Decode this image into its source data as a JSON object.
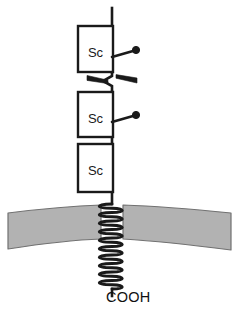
{
  "figure": {
    "background_color": "#ffffff",
    "stroke_color": "#1a1a1a",
    "width": 238,
    "height": 329
  },
  "backbone": {
    "name": "polypeptide-backbone",
    "stroke_color": "#1a1a1a",
    "stroke_width": 2.6,
    "top_y": 8,
    "x": 112
  },
  "domains": [
    {
      "label": "Sc",
      "x": 78,
      "y": 26,
      "width": 35,
      "height": 46,
      "fill": "#ffffff",
      "stroke": "#1a1a1a"
    },
    {
      "label": "Sc",
      "x": 78,
      "y": 92,
      "width": 35,
      "height": 45,
      "fill": "#ffffff",
      "stroke": "#1a1a1a"
    },
    {
      "label": "Sc",
      "x": 78,
      "y": 144,
      "width": 35,
      "height": 48,
      "fill": "#ffffff",
      "stroke": "#1a1a1a"
    }
  ],
  "glycosylation_sites": [
    {
      "name": "glycosylation-site-upper",
      "stem_x1": 112,
      "stem_y1": 57,
      "stem_x2": 134,
      "stem_y2": 51,
      "dot_x": 136,
      "dot_y": 50,
      "dot_r": 3.4
    },
    {
      "name": "glycosylation-site-lower",
      "stem_x1": 112,
      "stem_y1": 122,
      "stem_x2": 134,
      "stem_y2": 116,
      "dot_x": 136,
      "dot_y": 115,
      "dot_r": 3.4
    }
  ],
  "hinge": {
    "name": "disulfide-hinge",
    "description": "bowtie-shaped linker between first and second domain",
    "center_x": 112,
    "center_y": 79,
    "left_wedge": "M 89,76 L 110,80 L 110,83 L 89,80 Z",
    "right_wedge": "M 135,82 L 113,77 L 113,74 L 135,79 Z",
    "zigzag": "M 112,72 L 112,76 L 104,81 L 112,86 L 112,92"
  },
  "membrane": {
    "name": "lipid-bilayer-band",
    "fill": "#b2b2b2",
    "stroke": "#6e6e6e",
    "left_top_y": 212,
    "left_bottom_y": 248,
    "right_top_y": 212,
    "right_bottom_y": 250,
    "center_top_y": 206,
    "center_bottom_y": 240,
    "gap_left_x": 100,
    "gap_right_x": 124
  },
  "transmembrane_helix": {
    "name": "transmembrane-helix",
    "turns": 10,
    "top_y": 204,
    "bottom_y": 289,
    "amplitude": 11,
    "stroke_width": 2.8
  },
  "labels": {
    "c_terminus": "COOH",
    "c_terminus_x": 106,
    "c_terminus_y": 302
  }
}
